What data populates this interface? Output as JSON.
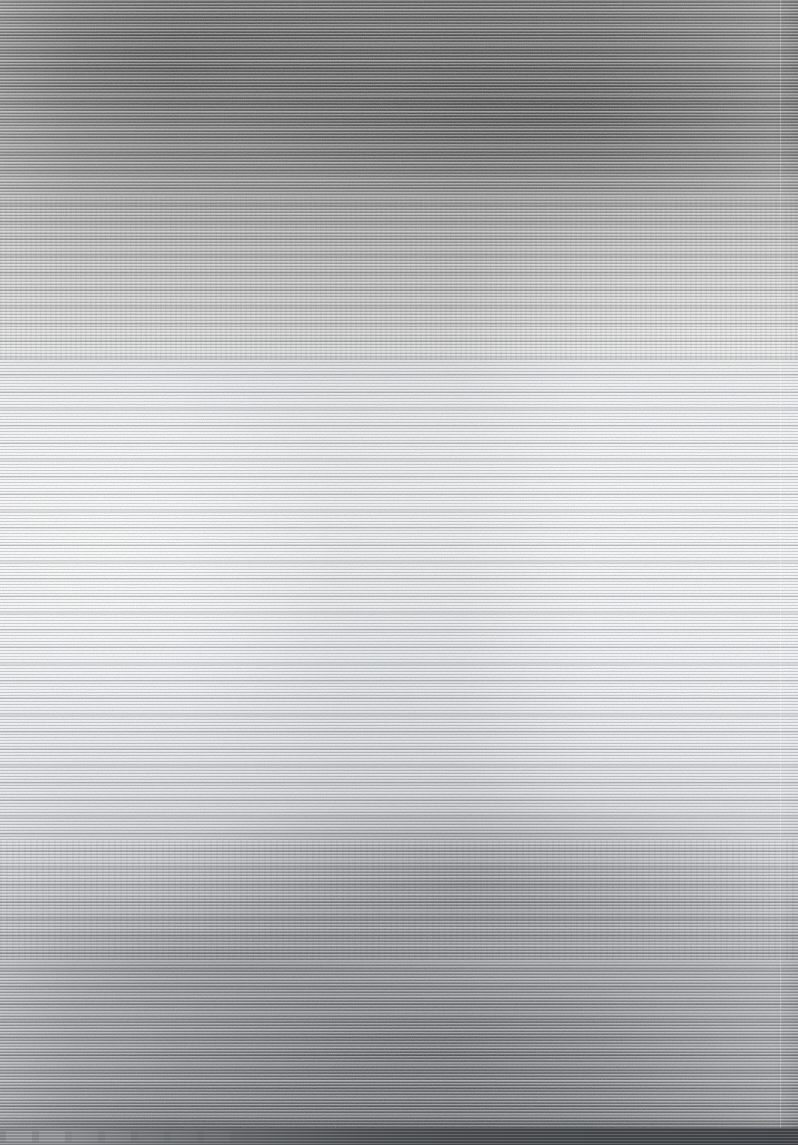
{
  "image": {
    "width": 798,
    "height": 1145,
    "legibility": "none",
    "description": "Severely corrupted screenshot. The entire frame is overwritten by dense horizontal scanline interference (venetian-blind / signal-loss artifact). No text, icons, labels, numbers, or UI widgets are legible at any zoom level.",
    "artifact_type": "horizontal-scanline-interference"
  },
  "regions": [
    {
      "name": "top-dark-band",
      "y_start": 0,
      "y_end": 200,
      "mean_color": "#6d6d6d",
      "note": "Uniform dark gray band spanning full width. Possible window chrome or toolbar, but no controls, title text or buttons are resolvable."
    },
    {
      "name": "upper-transition-band",
      "y_start": 200,
      "y_end": 350,
      "mean_color": "#b4b4b4",
      "note": "Mid-gray transition with faint high-frequency dotted texture suggestive of rows of small text. Characters are not resolvable."
    },
    {
      "name": "page-body",
      "y_start": 350,
      "y_end": 800,
      "mean_color": "#f5f8fa",
      "note": "Bright near-white region resembling a blank document or page canvas. A radial bright hotspot sits near x=105, y=552."
    },
    {
      "name": "lower-transition-band",
      "y_start": 800,
      "y_end": 1125,
      "mean_color": "#a5a9ad",
      "note": "Progressive darkening back toward mid-gray, with dark blotch clusters near x=470 y=880 and x=430 y=1050."
    },
    {
      "name": "bottom-bar",
      "y_start": 1125,
      "y_end": 1145,
      "mean_color": "#56595d",
      "note": "Dark horizontal strip at the very bottom edge. Faint evenly spaced rectangular blocks appear on the left portion, consistent with taskbar buttons, but no icon glyphs or labels are resolvable."
    }
  ],
  "edges": [
    {
      "name": "right-boundary",
      "orientation": "vertical",
      "x": 780,
      "note": "Faint vertical edge near the right side, consistent with a page margin or scrollbar boundary."
    }
  ],
  "colors": {
    "top_band": "#6d6d6d",
    "transition_band": "#b4b4b4",
    "page_body": "#f5f8fa",
    "lower_band": "#a5a9ad",
    "bottom_bar": "#56595d",
    "background": "#9a9a9a"
  },
  "extracted_text": []
}
